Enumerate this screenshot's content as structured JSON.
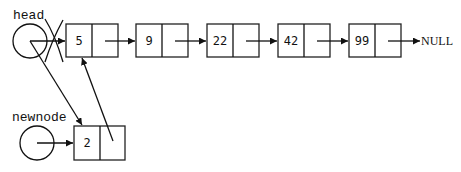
{
  "diagram": {
    "labels": {
      "head": "head",
      "newnode": "newnode",
      "null": "NULL"
    },
    "list_nodes": [
      {
        "value": "5"
      },
      {
        "value": "9"
      },
      {
        "value": "22"
      },
      {
        "value": "42"
      },
      {
        "value": "99"
      }
    ],
    "new_node": {
      "value": "2"
    },
    "edges": [
      {
        "from": "head",
        "to": "node-5",
        "status": "removed (crossed out)"
      },
      {
        "from": "head",
        "to": "newnode-2",
        "status": "new"
      },
      {
        "from": "newnode",
        "to": "newnode-2"
      },
      {
        "from": "newnode-2.next",
        "to": "node-5",
        "status": "new"
      },
      {
        "from": "node-5",
        "to": "node-9"
      },
      {
        "from": "node-9",
        "to": "node-22"
      },
      {
        "from": "node-22",
        "to": "node-42"
      },
      {
        "from": "node-42",
        "to": "node-99"
      },
      {
        "from": "node-99",
        "to": "NULL"
      }
    ],
    "colors": {
      "stroke": "#111111",
      "background": "#ffffff"
    }
  }
}
